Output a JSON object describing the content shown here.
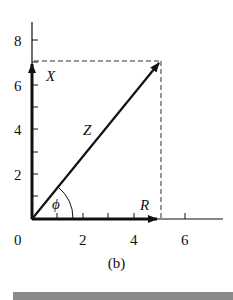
{
  "figure": {
    "caption": "(b)",
    "x_ticks": [
      "0",
      "2",
      "4",
      "6"
    ],
    "y_ticks": [
      "2",
      "4",
      "6",
      "8"
    ],
    "labels": {
      "vertical_vector": "X",
      "horizontal_vector": "R",
      "resultant_vector": "Z",
      "angle": "ϕ"
    },
    "vectors": [
      {
        "name": "R",
        "from": [
          0,
          0
        ],
        "to": [
          5,
          0
        ]
      },
      {
        "name": "X",
        "from": [
          0,
          0
        ],
        "to": [
          0,
          7
        ]
      },
      {
        "name": "Z",
        "from": [
          0,
          0
        ],
        "to": [
          5,
          7
        ]
      }
    ],
    "colors": {
      "ink": "#111111",
      "bar": "#8a8a8a"
    }
  }
}
